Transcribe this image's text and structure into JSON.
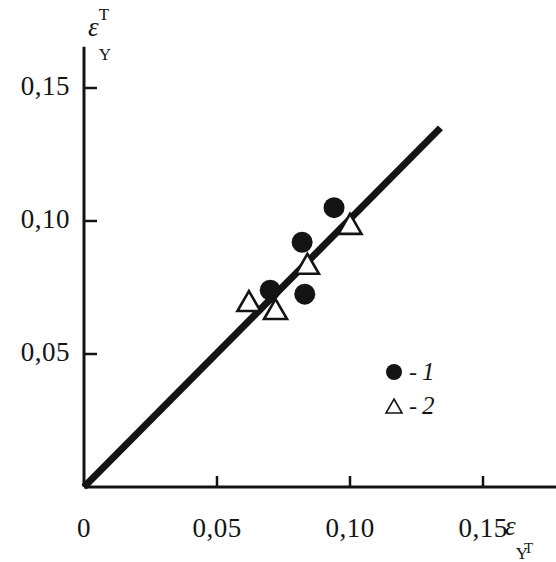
{
  "chart_data": {
    "type": "scatter",
    "title": "",
    "xlabel": "εY T",
    "ylabel": "εY T",
    "xlim": [
      0,
      0.1775
    ],
    "ylim": [
      0,
      0.1655
    ],
    "grid": false,
    "legend_position": "inside-lower-right",
    "x_tick_labels": [
      "0",
      "0,05",
      "0,10",
      "0,15"
    ],
    "x_tick_values": [
      0,
      0.05,
      0.1,
      0.15
    ],
    "y_tick_labels": [
      "0,05",
      "0,10",
      "0,15"
    ],
    "y_tick_values": [
      0.05,
      0.1,
      0.15
    ],
    "series": [
      {
        "name": "1",
        "marker": "filled-circle",
        "color": "#141414",
        "points": [
          {
            "x": 0.07,
            "y": 0.074
          },
          {
            "x": 0.082,
            "y": 0.092
          },
          {
            "x": 0.083,
            "y": 0.0725
          },
          {
            "x": 0.094,
            "y": 0.105
          }
        ]
      },
      {
        "name": "2",
        "marker": "open-triangle",
        "color": "#141414",
        "points": [
          {
            "x": 0.062,
            "y": 0.069
          },
          {
            "x": 0.072,
            "y": 0.066
          },
          {
            "x": 0.084,
            "y": 0.083
          },
          {
            "x": 0.1,
            "y": 0.098
          }
        ]
      }
    ],
    "reference_line": {
      "name": "identity-line",
      "from": {
        "x": 0.0,
        "y": 0.0
      },
      "to": {
        "x": 0.134,
        "y": 0.135
      },
      "color": "#141414"
    }
  },
  "axes": {
    "y_title": {
      "base": "ε",
      "sup": "T",
      "sub": "Y"
    },
    "x_title": {
      "base": "ε",
      "sub": "Y",
      "sub2": "T"
    }
  },
  "legend": {
    "items": [
      {
        "marker": "filled-circle",
        "dash": "-",
        "label": "1"
      },
      {
        "marker": "open-triangle",
        "dash": "-",
        "label": "2"
      }
    ]
  }
}
